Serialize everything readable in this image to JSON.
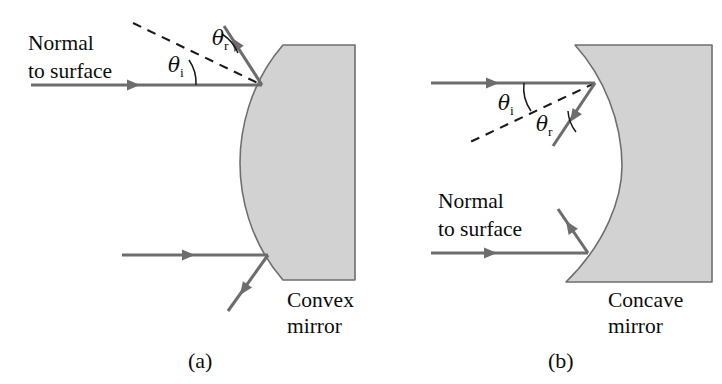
{
  "figure": {
    "background_color": "#ffffff",
    "mirror_fill_color": "#d2d2d2",
    "mirror_edge_color": "#6f6f6f",
    "ray_color": "#6d6d6d",
    "normal_color": "#1a1a1a",
    "text_color": "#0d0d0d",
    "width": 722,
    "height": 384
  },
  "panels": [
    {
      "id": "panel-a",
      "caption": "(a)",
      "caption_x": 188,
      "caption_y": 368,
      "mirror_name": "convex",
      "mirror_label_line1": "Convex",
      "mirror_label_line2": "mirror",
      "mirror_label_x": 287,
      "mirror_label_y1": 307,
      "mirror_label_y2": 333,
      "normal_label_line1": "Normal",
      "normal_label_line2": "to surface",
      "normal_label_x": 28,
      "normal_label_y1": 50,
      "normal_label_y2": 78,
      "mirror_path": "M 283 45 L 355 45 L 355 280 L 283 280 C 249 241 240 195 240 163 C 240 131 249 84 283 45 Z",
      "angles": [
        {
          "name": "theta-i",
          "symbol": "θ",
          "subscript": "i",
          "x": 168,
          "y": 72,
          "arc_path": "M 196 85 A 40 40 0 0 0 189 60"
        },
        {
          "name": "theta-r",
          "symbol": "θ",
          "subscript": "r",
          "x": 212,
          "y": 45,
          "arc_path": "M 238 53 A 42 42 0 0 0 222 34"
        }
      ],
      "normals": [
        {
          "name": "normal-ray-1",
          "x1": 133,
          "y1": 23,
          "x2": 262,
          "y2": 85
        }
      ],
      "rays": [
        {
          "name": "incident-ray-1",
          "x1": 31,
          "y1": 85,
          "x2": 262,
          "y2": 85,
          "head_x": 140,
          "head_y": 85,
          "head_angle": 0
        },
        {
          "name": "reflected-ray-1",
          "x1": 262,
          "y1": 85,
          "x2": 224,
          "y2": 26,
          "head_x": 232,
          "head_y": 38,
          "head_angle": 237
        },
        {
          "name": "incident-ray-2",
          "x1": 122,
          "y1": 255,
          "x2": 268,
          "y2": 255,
          "head_x": 195,
          "head_y": 255,
          "head_angle": 0
        },
        {
          "name": "reflected-ray-2",
          "x1": 268,
          "y1": 255,
          "x2": 228,
          "y2": 311,
          "head_x": 240,
          "head_y": 295,
          "head_angle": 125
        }
      ]
    },
    {
      "id": "panel-b",
      "caption": "(b)",
      "caption_x": 548,
      "caption_y": 368,
      "mirror_name": "concave",
      "mirror_label_line1": "Concave",
      "mirror_label_line2": "mirror",
      "mirror_label_x": 608,
      "mirror_label_y1": 307,
      "mirror_label_y2": 333,
      "normal_label_line1": "Normal",
      "normal_label_line2": "to surface",
      "normal_label_x": 438,
      "normal_label_y1": 208,
      "normal_label_y2": 236,
      "mirror_path": "M 575 45 L 712 45 L 712 282 L 566 282 C 606 243 622 198 622 166 C 622 122 604 77 575 45 Z",
      "angles": [
        {
          "name": "theta-i",
          "symbol": "θ",
          "subscript": "i",
          "x": 498,
          "y": 110,
          "arc_path": "M 524 83 A 40 40 0 0 0 531 111"
        },
        {
          "name": "theta-r",
          "symbol": "θ",
          "subscript": "r",
          "x": 536,
          "y": 131,
          "arc_path": "M 568 111 A 38 38 0 0 0 576 132"
        }
      ],
      "normals": [
        {
          "name": "normal-ray-1",
          "x1": 595,
          "y1": 83,
          "x2": 468,
          "y2": 143
        }
      ],
      "rays": [
        {
          "name": "incident-ray-1",
          "x1": 431,
          "y1": 83,
          "x2": 595,
          "y2": 83,
          "head_x": 499,
          "head_y": 83,
          "head_angle": 0
        },
        {
          "name": "reflected-ray-1",
          "x1": 595,
          "y1": 83,
          "x2": 553,
          "y2": 146,
          "head_x": 570,
          "head_y": 122,
          "head_angle": 124
        },
        {
          "name": "incident-ray-2",
          "x1": 431,
          "y1": 253,
          "x2": 588,
          "y2": 253,
          "head_x": 497,
          "head_y": 253,
          "head_angle": 0
        },
        {
          "name": "reflected-ray-2",
          "x1": 588,
          "y1": 253,
          "x2": 558,
          "y2": 209,
          "head_x": 566,
          "head_y": 221,
          "head_angle": 236
        }
      ]
    }
  ]
}
